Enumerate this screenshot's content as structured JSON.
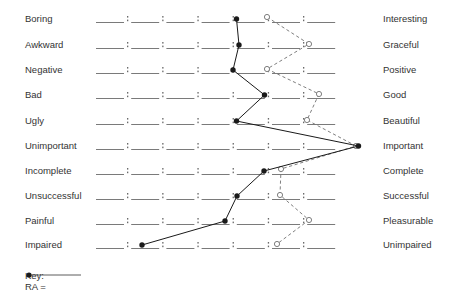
{
  "chart_data": {
    "type": "line",
    "title": "",
    "subtitle": "",
    "xlabel": "",
    "ylabel": "",
    "scale_points": 7,
    "scale_separator": ":",
    "grid": false,
    "legend_position": "bottom-left",
    "categories": [
      "Boring — Interesting",
      "Awkward — Graceful",
      "Negative — Positive",
      "Bad — Good",
      "Ugly — Beautiful",
      "Unimportant — Important",
      "Incomplete — Complete",
      "Unsuccessful — Successful",
      "Painful — Pleasurable",
      "Impaired — Unimpaired"
    ],
    "left_anchors": [
      "Boring",
      "Awkward",
      "Negative",
      "Bad",
      "Ugly",
      "Unimportant",
      "Incomplete",
      "Unsuccessful",
      "Painful",
      "Impaired"
    ],
    "right_anchors": [
      "Interesting",
      "Graceful",
      "Positive",
      "Good",
      "Beautiful",
      "Important",
      "Complete",
      "Successful",
      "Pleasurable",
      "Unimpaired"
    ],
    "series": [
      {
        "name": "RA",
        "marker": "filled-circle",
        "line_style": "solid",
        "color": "#1a1a1a",
        "values": [
          5.0,
          5.1,
          4.9,
          5.8,
          5.0,
          8.5,
          5.8,
          5.0,
          4.7,
          2.3
        ]
      },
      {
        "name": "",
        "marker": "open-circle",
        "line_style": "dashed",
        "color": "#6e6e6e",
        "values": [
          5.9,
          7.1,
          5.9,
          7.4,
          7.0,
          8.5,
          6.3,
          6.3,
          7.1,
          6.2
        ]
      }
    ],
    "xlim": [
      1,
      7
    ]
  },
  "key": {
    "title": "Key:",
    "entries": [
      {
        "label": "RA =",
        "marker": "filled-circle-line"
      }
    ]
  },
  "points": {
    "ra_px": [
      {
        "x": 236.5,
        "y": 19
      },
      {
        "x": 239.0,
        "y": 45
      },
      {
        "x": 233.0,
        "y": 70
      },
      {
        "x": 264.5,
        "y": 95
      },
      {
        "x": 236.5,
        "y": 121
      },
      {
        "x": 358.5,
        "y": 146
      },
      {
        "x": 264.0,
        "y": 171
      },
      {
        "x": 237.0,
        "y": 196
      },
      {
        "x": 225.0,
        "y": 221
      },
      {
        "x": 142.0,
        "y": 245
      }
    ],
    "alt_px": [
      {
        "x": 267.0,
        "y": 17
      },
      {
        "x": 309.0,
        "y": 44
      },
      {
        "x": 267.0,
        "y": 69
      },
      {
        "x": 319.0,
        "y": 94
      },
      {
        "x": 307.0,
        "y": 120
      },
      {
        "x": 356.0,
        "y": 146
      },
      {
        "x": 281.0,
        "y": 169
      },
      {
        "x": 280.0,
        "y": 195
      },
      {
        "x": 309.0,
        "y": 220
      },
      {
        "x": 277.0,
        "y": 244
      }
    ]
  },
  "colors": {
    "text": "#333333",
    "rule": "#6b6b6b",
    "ra_line": "#1a1a1a",
    "alt_line": "#707070"
  }
}
